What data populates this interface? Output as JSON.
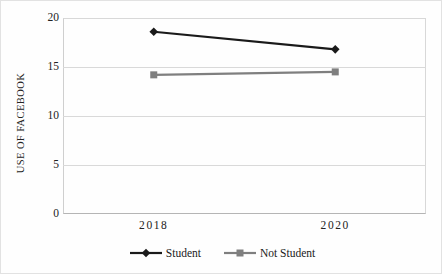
{
  "chart_data": {
    "type": "line",
    "title": "",
    "xlabel": "",
    "ylabel": "USE OF FACEBOOK",
    "categories": [
      "2018",
      "2020"
    ],
    "series": [
      {
        "name": "Student",
        "values": [
          18.6,
          16.8
        ],
        "color": "#1a1a1a",
        "marker": "diamond"
      },
      {
        "name": "Not Student",
        "values": [
          14.2,
          14.5
        ],
        "color": "#7f7f7f",
        "marker": "square"
      }
    ],
    "ylim": [
      0,
      20
    ],
    "yticks": [
      0,
      5,
      10,
      15,
      20
    ],
    "ytick_labels": [
      "0",
      "5",
      "10",
      "15",
      "20"
    ],
    "grid": true,
    "legend_position": "bottom"
  },
  "axes": {
    "y_title": "USE OF FACEBOOK",
    "y_ticks": [
      {
        "label": "20",
        "value": 20
      },
      {
        "label": "15",
        "value": 15
      },
      {
        "label": "10",
        "value": 10
      },
      {
        "label": "5",
        "value": 5
      },
      {
        "label": "0",
        "value": 0
      }
    ],
    "x_ticks": [
      {
        "label": "2018",
        "value": 0
      },
      {
        "label": "2020",
        "value": 1
      }
    ]
  },
  "legend": {
    "items": [
      {
        "label": "Student",
        "color": "#1a1a1a",
        "marker": "diamond"
      },
      {
        "label": "Not Student",
        "color": "#7f7f7f",
        "marker": "square"
      }
    ]
  },
  "colors": {
    "student": "#1a1a1a",
    "not_student": "#7f7f7f",
    "gridline": "#d9d9d9",
    "frame": "#cfcfcf",
    "text": "#1a1a1a",
    "background": "#ffffff"
  }
}
